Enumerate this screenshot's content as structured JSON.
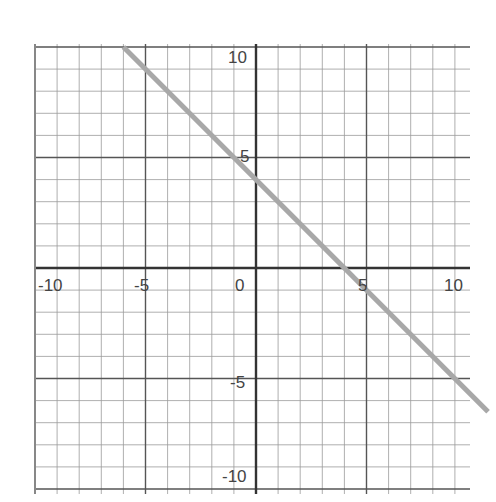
{
  "chart_data": {
    "type": "line",
    "title": "",
    "xlabel": "",
    "ylabel": "",
    "xlim": [
      -10,
      10
    ],
    "ylim": [
      -10,
      10
    ],
    "grid": true,
    "grid_step": 1,
    "major_step": 5,
    "x_tick_labels": [
      "-10",
      "-5",
      "0",
      "5",
      "10"
    ],
    "y_tick_labels": [
      "10",
      "5",
      "-5",
      "-10"
    ],
    "series": [
      {
        "name": "y = -x + 4",
        "x": [
          -6,
          10.5
        ],
        "y": [
          10,
          -6.5
        ],
        "slope": -1,
        "intercept": 4,
        "color": "#a8a8a8"
      }
    ],
    "colors": {
      "axis": "#333333",
      "major_grid": "#555555",
      "minor_grid": "#9a9a9a",
      "line": "#a8a8a8"
    }
  }
}
